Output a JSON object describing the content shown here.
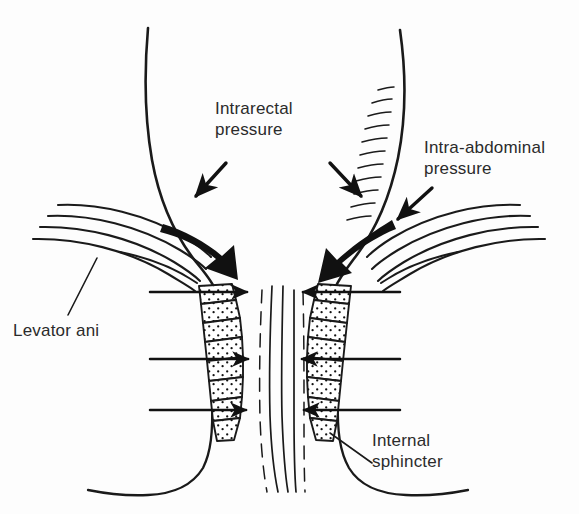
{
  "figure": {
    "type": "anatomical-line-diagram",
    "background_color": "#fdfdfd",
    "ink_color": "#1a1a1a",
    "text_color": "#2b2b2b"
  },
  "labels": {
    "intrarectal_pressure": "Intrarectal\npressure",
    "intra_abdominal_pressure": "Intra-abdominal\npressure",
    "levator_ani": "Levator ani",
    "internal_sphincter": "Internal\nsphincter"
  },
  "annotations": {
    "thin_pressure_arrows": 2,
    "thick_force_arrows": 2,
    "sphincter_pressure_arrows_per_side": 3,
    "levator_fibre_lines_per_side": 5,
    "sphincter_bands_per_side": 8,
    "rectal_wall_hatch_marks": 11
  }
}
